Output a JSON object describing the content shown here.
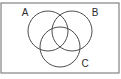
{
  "figure": {
    "type": "venn-diagram",
    "background_color": "#ffffff",
    "frame": {
      "visible": true,
      "stroke_color": "#6b6b6b",
      "x": 1,
      "y": 3,
      "width": 118,
      "height": 70
    },
    "stroke_color": "#3a3a3a",
    "label_color": "#2b2b2b",
    "sets": [
      {
        "id": "set-a",
        "label": "A",
        "cx": 48,
        "cy": 31,
        "r": 20,
        "label_x": 25,
        "label_y": 13
      },
      {
        "id": "set-b",
        "label": "B",
        "cx": 72,
        "cy": 31,
        "r": 20,
        "label_x": 95,
        "label_y": 13
      },
      {
        "id": "set-c",
        "label": "C",
        "cx": 60,
        "cy": 47,
        "r": 20,
        "label_x": 85,
        "label_y": 64
      }
    ]
  }
}
